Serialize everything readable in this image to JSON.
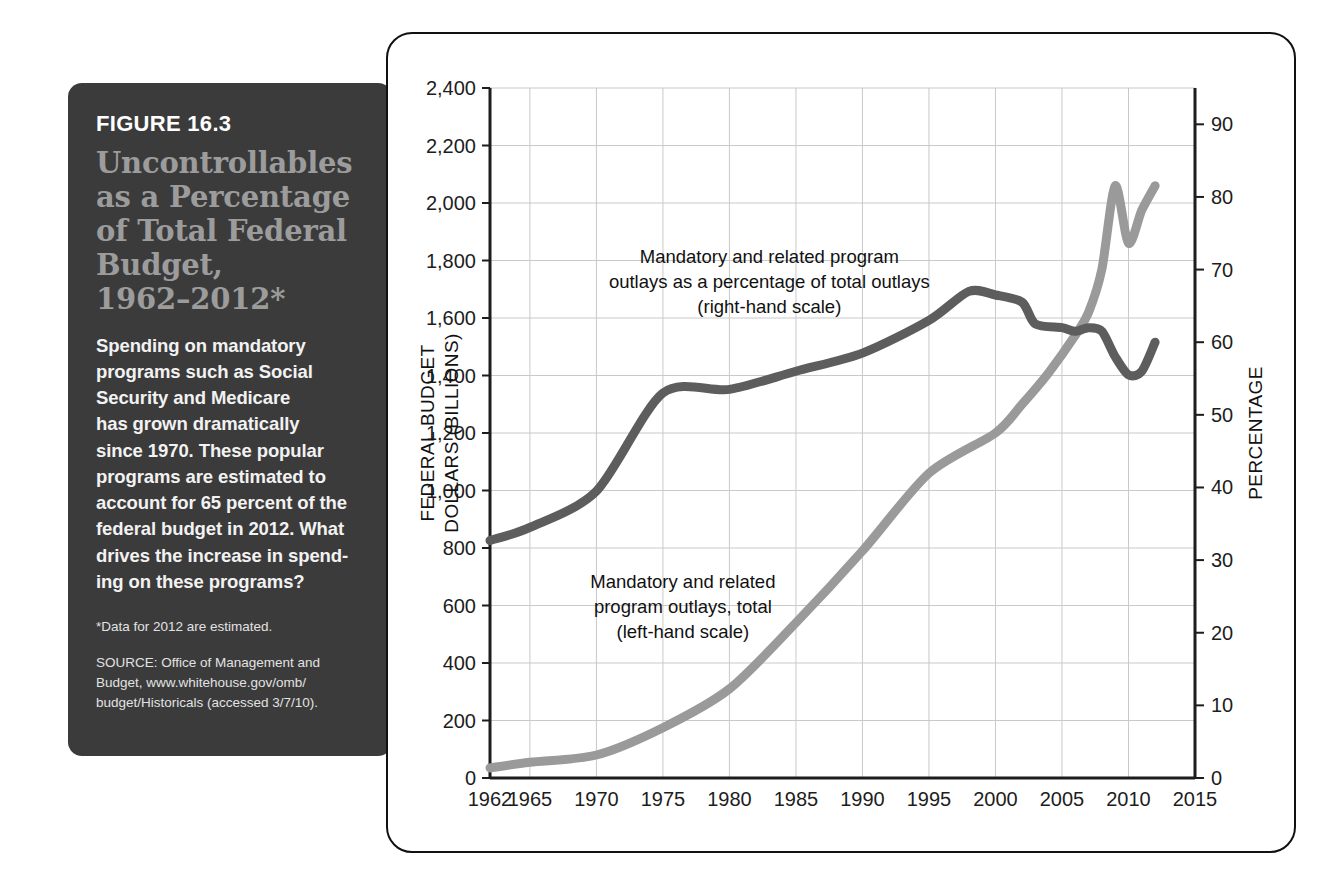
{
  "figure": {
    "number": "FIGURE 16.3",
    "title": "Uncontrollables\nas a Percentage\nof Total Federal\nBudget,\n1962–2012*",
    "body": "Spending on mandatory\nprograms such as Social\nSecurity and Medicare\nhas grown dramatically\nsince 1970. These popular\nprograms are estimated to\naccount for 65 percent of the\nfederal budget in 2012. What\ndrives the increase in spend-\ning on these programs?",
    "note": "*Data for 2012 are estimated.",
    "source": "SOURCE: Office of Management and\nBudget, www.whitehouse.gov/omb/\nbudget/Historicals (accessed 3/7/10)."
  },
  "colors": {
    "panel_background": "#3b3b3b",
    "panel_title": "#9c9c9c",
    "series_total_outlays": "#9a9a9a",
    "series_percentage": "#5d5d5d",
    "grid": "#c9c9c9",
    "axis": "#1d1d1d"
  },
  "chart_data": {
    "type": "line",
    "title": "",
    "xlabel": "",
    "ylabel": "FEDERAL BUDGET DOLLARS (BILLIONS)",
    "y2label": "PERCENTAGE",
    "xlim": [
      1962,
      2015
    ],
    "ylim": [
      0,
      2400
    ],
    "y2lim": [
      0,
      95
    ],
    "grid": true,
    "legend": "annotations-inline",
    "xticks": [
      "1962",
      "1965",
      "1970",
      "1975",
      "1980",
      "1985",
      "1990",
      "1995",
      "2000",
      "2005",
      "2010",
      "2015"
    ],
    "xtick_values": [
      1962,
      1965,
      1970,
      1975,
      1980,
      1985,
      1990,
      1995,
      2000,
      2005,
      2010,
      2015
    ],
    "yticks": [
      "0",
      "200",
      "400",
      "600",
      "800",
      "1,000",
      "1,200",
      "1,400",
      "1,600",
      "1,800",
      "2,000",
      "2,200",
      "2,400"
    ],
    "ytick_values": [
      0,
      200,
      400,
      600,
      800,
      1000,
      1200,
      1400,
      1600,
      1800,
      2000,
      2200,
      2400
    ],
    "y2ticks": [
      "0",
      "10",
      "20",
      "30",
      "40",
      "50",
      "60",
      "70",
      "80",
      "90"
    ],
    "y2tick_values": [
      0,
      10,
      20,
      30,
      40,
      50,
      60,
      70,
      80,
      90
    ],
    "annotations": [
      {
        "name": "percentage-series-label",
        "text": "Mandatory and related program\noutlays as a percentage of total outlays\n(right-hand scale)",
        "x": 1983.0,
        "y": 1790
      },
      {
        "name": "total-series-label",
        "text": "Mandatory and related\nprogram outlays, total\n(left-hand scale)",
        "x": 1976.5,
        "y": 660
      }
    ],
    "series": [
      {
        "name": "Mandatory and related program outlays, total (left-hand scale)",
        "axis": "left",
        "unit": "billions of dollars",
        "color": "#9a9a9a",
        "x": [
          1962,
          1965,
          1970,
          1975,
          1980,
          1985,
          1990,
          1995,
          2000,
          2002,
          2004,
          2006,
          2007,
          2008,
          2009,
          2010,
          2011,
          2012
        ],
        "values": [
          35,
          55,
          80,
          175,
          310,
          540,
          790,
          1060,
          1200,
          1300,
          1410,
          1540,
          1620,
          1770,
          2060,
          1860,
          1975,
          2060
        ]
      },
      {
        "name": "Mandatory and related program outlays as a percentage of total outlays (right-hand scale)",
        "axis": "right",
        "unit": "percent of total outlays",
        "color": "#5d5d5d",
        "x": [
          1962,
          1965,
          1970,
          1975,
          1980,
          1985,
          1990,
          1995,
          1998,
          2000,
          2002,
          2003,
          2005,
          2006,
          2007,
          2008,
          2009,
          2010,
          2011,
          2012
        ],
        "values": [
          32.7,
          34.5,
          39.5,
          53.0,
          53.5,
          56.0,
          58.5,
          63.0,
          67.0,
          66.5,
          65.5,
          62.5,
          62.0,
          61.5,
          62.0,
          61.5,
          58.0,
          55.5,
          56.0,
          60.0
        ],
        "values_left_scale_equivalent": [
          830,
          875,
          990,
          1345,
          1355,
          1420,
          1485,
          1600,
          1700,
          1690,
          1665,
          1590,
          1575,
          1565,
          1575,
          1560,
          1470,
          1410,
          1420,
          1520
        ]
      }
    ]
  }
}
